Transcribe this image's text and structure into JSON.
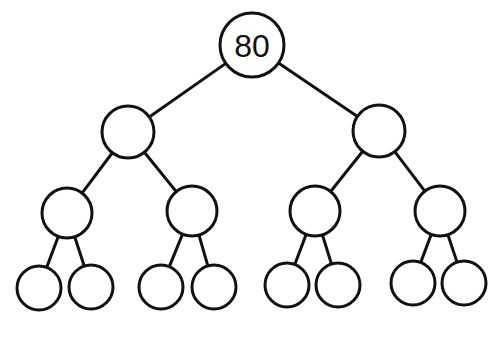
{
  "diagram": {
    "type": "binary-tree",
    "levels": 4,
    "stroke_color": "#111111",
    "fill_color": "#ffffff",
    "nodes": [
      {
        "id": "n0",
        "label": "80",
        "cx": 252,
        "cy": 45,
        "r": 32
      },
      {
        "id": "n1",
        "label": "",
        "cx": 128,
        "cy": 132,
        "r": 26
      },
      {
        "id": "n2",
        "label": "",
        "cx": 379,
        "cy": 131,
        "r": 26
      },
      {
        "id": "n3",
        "label": "",
        "cx": 67,
        "cy": 213,
        "r": 25
      },
      {
        "id": "n4",
        "label": "",
        "cx": 192,
        "cy": 211,
        "r": 25
      },
      {
        "id": "n5",
        "label": "",
        "cx": 315,
        "cy": 211,
        "r": 25
      },
      {
        "id": "n6",
        "label": "",
        "cx": 440,
        "cy": 211,
        "r": 25
      },
      {
        "id": "n7",
        "label": "",
        "cx": 39,
        "cy": 288,
        "r": 22
      },
      {
        "id": "n8",
        "label": "",
        "cx": 91,
        "cy": 287,
        "r": 22
      },
      {
        "id": "n9",
        "label": "",
        "cx": 161,
        "cy": 287,
        "r": 22
      },
      {
        "id": "n10",
        "label": "",
        "cx": 214,
        "cy": 287,
        "r": 22
      },
      {
        "id": "n11",
        "label": "",
        "cx": 287,
        "cy": 285,
        "r": 22
      },
      {
        "id": "n12",
        "label": "",
        "cx": 338,
        "cy": 285,
        "r": 22
      },
      {
        "id": "n13",
        "label": "",
        "cx": 413,
        "cy": 283,
        "r": 22
      },
      {
        "id": "n14",
        "label": "",
        "cx": 464,
        "cy": 283,
        "r": 22
      }
    ],
    "edges": [
      [
        "n0",
        "n1"
      ],
      [
        "n0",
        "n2"
      ],
      [
        "n1",
        "n3"
      ],
      [
        "n1",
        "n4"
      ],
      [
        "n2",
        "n5"
      ],
      [
        "n2",
        "n6"
      ],
      [
        "n3",
        "n7"
      ],
      [
        "n3",
        "n8"
      ],
      [
        "n4",
        "n9"
      ],
      [
        "n4",
        "n10"
      ],
      [
        "n5",
        "n11"
      ],
      [
        "n5",
        "n12"
      ],
      [
        "n6",
        "n13"
      ],
      [
        "n6",
        "n14"
      ]
    ]
  }
}
